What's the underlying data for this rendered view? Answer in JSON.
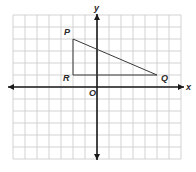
{
  "diagram": {
    "type": "coordinate-grid",
    "colors": {
      "background": "#ffffff",
      "grid": "#c8c8c8",
      "axis": "#1a1a1a",
      "segment": "#3a3a3a",
      "label": "#2a2a2a"
    },
    "grid": {
      "x_min": -7,
      "x_max": 7,
      "y_min": -6,
      "y_max": 6,
      "unit_px": 12,
      "note": "Grid extents and unit size are approximate, estimated from pixel positions"
    },
    "axes": {
      "x_label": "x",
      "y_label": "y",
      "origin_label": "O"
    },
    "points": [
      {
        "name": "P",
        "x": -2,
        "y": 4,
        "estimated": true,
        "note": "Read as ~3.75 grid units above the x-axis; rounded to 4"
      },
      {
        "name": "Q",
        "x": 5,
        "y": 1,
        "estimated": true
      },
      {
        "name": "R",
        "x": -2,
        "y": 1,
        "estimated": true
      }
    ],
    "segments": [
      {
        "from": "P",
        "to": "Q"
      },
      {
        "from": "P",
        "to": "R"
      },
      {
        "from": "R",
        "to": "Q"
      }
    ]
  }
}
